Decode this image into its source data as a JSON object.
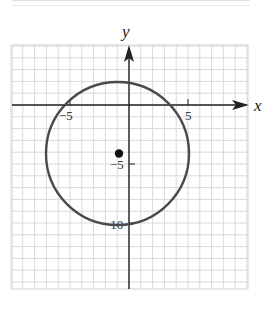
{
  "figure": {
    "x_axis_label": "x",
    "y_axis_label": "y",
    "tick_labels": {
      "x_neg5": "−5",
      "x_pos5": "5",
      "y_neg5": "−5",
      "y_neg10": "−10"
    }
  },
  "chart_data": {
    "type": "scatter",
    "title": "",
    "xlabel": "x",
    "ylabel": "y",
    "xlim": [
      -10,
      10
    ],
    "ylim": [
      -15.5,
      5
    ],
    "grid": true,
    "x_ticks_labeled": [
      -5,
      5
    ],
    "y_ticks_labeled": [
      -5,
      -10
    ],
    "shapes": [
      {
        "kind": "circle",
        "center": [
          -1,
          -4
        ],
        "radius": 6,
        "stroke": "#444444"
      }
    ],
    "points": [
      {
        "label": "center",
        "x": -1,
        "y": -4
      }
    ]
  },
  "colors": {
    "grid": "#d9d9d9",
    "axis": "#222222",
    "circle": "#4a4a4a",
    "point": "#111111"
  }
}
